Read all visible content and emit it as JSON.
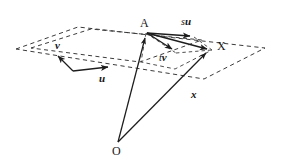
{
  "figure": {
    "kind": "vector-geometry-diagram",
    "background_color": "#ffffff",
    "ink_color": "#222222",
    "dash_color": "#3a3a3a",
    "width": 281,
    "height": 167
  },
  "labels": {
    "point_A": "A",
    "point_X": "X",
    "point_O": "O",
    "vector_u": "u",
    "vector_v": "v",
    "scalar_s": "s",
    "scalar_t": "t",
    "su_scalar": "s",
    "su_vector": "u",
    "tv_scalar": "t",
    "tv_vector": "v",
    "vector_x": "x"
  },
  "geometry": {
    "outer_plane_vertices": "16,49 78,27 265,48 204,79",
    "inner_plane_vertices": "31,48 91,29 202,40 140,62",
    "point_A": {
      "x": 146,
      "y": 31
    },
    "point_X": {
      "x": 212,
      "y": 50
    },
    "point_O": {
      "x": 118,
      "y": 143
    },
    "vectors": [
      {
        "name": "u",
        "from": "73,71",
        "to": "111,67"
      },
      {
        "name": "v",
        "from": "73,71",
        "to": "56,55"
      },
      {
        "name": "su",
        "from": "146,32",
        "to": "194,36"
      },
      {
        "name": "tv",
        "from": "146,32",
        "to": "176,52"
      },
      {
        "name": "AX",
        "from": "146,32",
        "to": "210,50"
      },
      {
        "name": "OA",
        "from": "118,142",
        "to": "145,34"
      },
      {
        "name": "OX",
        "from": "118,142",
        "to": "211,52"
      }
    ]
  }
}
